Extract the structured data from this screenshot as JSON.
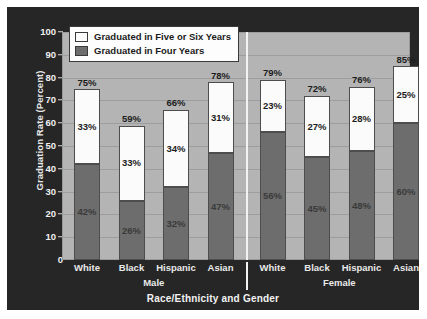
{
  "chart_data": {
    "type": "bar",
    "subtype": "stacked",
    "title": "",
    "xlabel": "Race/Ethnicity and Gender",
    "ylabel": "Graduation Rate (Percent)",
    "ylim": [
      0,
      100
    ],
    "ytick_labels": [
      "100",
      "90",
      "80",
      "70",
      "60",
      "50",
      "40",
      "30",
      "20",
      "10",
      "0"
    ],
    "ytick_values": [
      100,
      90,
      80,
      70,
      60,
      50,
      40,
      30,
      20,
      10,
      0
    ],
    "grid": true,
    "legend_position": "top-left-inside",
    "groups": [
      {
        "name": "Male",
        "label": "Male"
      },
      {
        "name": "Female",
        "label": "Female"
      }
    ],
    "categories": [
      "White",
      "Black",
      "Hispanic",
      "Asian",
      "White",
      "Black",
      "Hispanic",
      "Asian"
    ],
    "series": [
      {
        "name": "Graduated in Four Years",
        "color": "#6d6d6d",
        "values": [
          42,
          26,
          32,
          47,
          56,
          45,
          48,
          60
        ],
        "value_labels": [
          "42%",
          "26%",
          "32%",
          "47%",
          "56%",
          "45%",
          "48%",
          "60%"
        ]
      },
      {
        "name": "Graduated in Five or Six Years",
        "color": "#fbfbfb",
        "values": [
          33,
          33,
          34,
          31,
          23,
          27,
          28,
          25
        ],
        "value_labels": [
          "33%",
          "33%",
          "34%",
          "31%",
          "23%",
          "27%",
          "28%",
          "25%"
        ]
      }
    ],
    "totals": [
      75,
      59,
      66,
      78,
      79,
      72,
      76,
      85
    ],
    "total_labels": [
      "75%",
      "59%",
      "66%",
      "78%",
      "79%",
      "72%",
      "76%",
      "85%"
    ],
    "bars": [
      {
        "group": "Male",
        "category": "White",
        "four_year": 42,
        "five_or_six_year": 33,
        "total": 75,
        "four_year_label": "42%",
        "five_or_six_year_label": "33%",
        "total_label": "75%"
      },
      {
        "group": "Male",
        "category": "Black",
        "four_year": 26,
        "five_or_six_year": 33,
        "total": 59,
        "four_year_label": "26%",
        "five_or_six_year_label": "33%",
        "total_label": "59%"
      },
      {
        "group": "Male",
        "category": "Hispanic",
        "four_year": 32,
        "five_or_six_year": 34,
        "total": 66,
        "four_year_label": "32%",
        "five_or_six_year_label": "34%",
        "total_label": "66%"
      },
      {
        "group": "Male",
        "category": "Asian",
        "four_year": 47,
        "five_or_six_year": 31,
        "total": 78,
        "four_year_label": "47%",
        "five_or_six_year_label": "31%",
        "total_label": "78%"
      },
      {
        "group": "Female",
        "category": "White",
        "four_year": 56,
        "five_or_six_year": 23,
        "total": 79,
        "four_year_label": "56%",
        "five_or_six_year_label": "23%",
        "total_label": "79%"
      },
      {
        "group": "Female",
        "category": "Black",
        "four_year": 45,
        "five_or_six_year": 27,
        "total": 72,
        "four_year_label": "45%",
        "five_or_six_year_label": "27%",
        "total_label": "72%"
      },
      {
        "group": "Female",
        "category": "Hispanic",
        "four_year": 48,
        "five_or_six_year": 28,
        "total": 76,
        "four_year_label": "48%",
        "five_or_six_year_label": "28%",
        "total_label": "76%"
      },
      {
        "group": "Female",
        "category": "Asian",
        "four_year": 60,
        "five_or_six_year": 25,
        "total": 85,
        "four_year_label": "60%",
        "five_or_six_year_label": "25%",
        "total_label": "85%"
      }
    ],
    "legend": [
      {
        "label": "Graduated in Five or Six Years",
        "color": "#fbfbfb"
      },
      {
        "label": "Graduated in Four Years",
        "color": "#6d6d6d"
      }
    ],
    "colors": {
      "frame_background": "#262626",
      "plot_background": "#b4b4b4",
      "gridline": "#9d9d9d",
      "four_year_bar": "#6d6d6d",
      "five_or_six_year_bar": "#fbfbfb",
      "bar_outline": "#4d4d4d",
      "axis_text": "#e9e9e9",
      "divider": "#f2f2f2"
    }
  }
}
